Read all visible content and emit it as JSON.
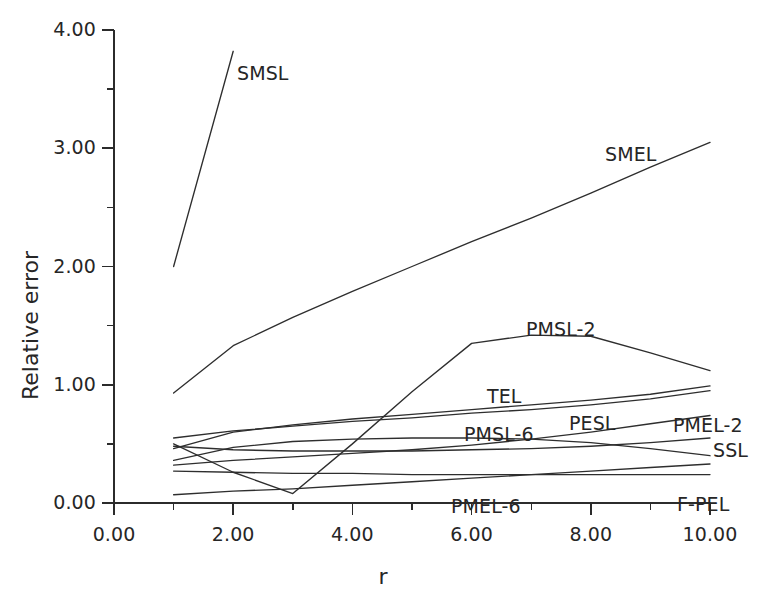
{
  "chart_data": {
    "type": "line",
    "title": "",
    "xlabel": "r",
    "ylabel": "Relative error",
    "xlim": [
      0,
      10
    ],
    "ylim": [
      0,
      4
    ],
    "grid": false,
    "legend": "inline-annotations",
    "x_ticks": [
      "0.00",
      "2.00",
      "4.00",
      "6.00",
      "8.00",
      "10.00"
    ],
    "x_tick_values": [
      0,
      2,
      4,
      6,
      8,
      10
    ],
    "x_minor_tick_values": [
      1,
      3,
      5,
      7,
      9
    ],
    "y_ticks": [
      "0.00",
      "1.00",
      "2.00",
      "3.00",
      "4.00"
    ],
    "y_tick_values": [
      0,
      1,
      2,
      3,
      4
    ],
    "y_minor_tick_values": [
      0.5,
      1.5,
      2.5,
      3.5
    ],
    "x": [
      1,
      2,
      3,
      4,
      5,
      6,
      7,
      8,
      9,
      10
    ],
    "series": [
      {
        "name": "SMSL",
        "label": "SMSL",
        "x": [
          1,
          2
        ],
        "values": [
          2.0,
          3.82
        ]
      },
      {
        "name": "SMEL",
        "label": "SMEL",
        "x": [
          1,
          2,
          3,
          4,
          5,
          6,
          7,
          8,
          9,
          10
        ],
        "values": [
          0.93,
          1.33,
          1.57,
          1.79,
          2.0,
          2.21,
          2.41,
          2.62,
          2.84,
          3.05
        ]
      },
      {
        "name": "PMSL-2",
        "label": "PMSL-2",
        "x": [
          1,
          2,
          3,
          4,
          5,
          6,
          7,
          8,
          9,
          10
        ],
        "values": [
          0.5,
          0.26,
          0.08,
          0.5,
          0.94,
          1.35,
          1.42,
          1.41,
          1.27,
          1.12
        ]
      },
      {
        "name": "TEL",
        "label": "TEL",
        "x": [
          1,
          2,
          3,
          4,
          5,
          6,
          7,
          8,
          9,
          10
        ],
        "values": [
          0.46,
          0.6,
          0.66,
          0.71,
          0.75,
          0.79,
          0.83,
          0.87,
          0.92,
          0.99
        ]
      },
      {
        "name": "PESL",
        "label": "PESL",
        "x": [
          1,
          2,
          3,
          4,
          5,
          6,
          7,
          8,
          9,
          10
        ],
        "values": [
          0.55,
          0.61,
          0.65,
          0.69,
          0.72,
          0.76,
          0.79,
          0.83,
          0.88,
          0.95
        ]
      },
      {
        "name": "PMSL-6",
        "label": "PMSL-6",
        "x": [
          1,
          2,
          3,
          4,
          5,
          6,
          7,
          8,
          9,
          10
        ],
        "values": [
          0.36,
          0.47,
          0.52,
          0.54,
          0.55,
          0.55,
          0.54,
          0.51,
          0.46,
          0.4
        ]
      },
      {
        "name": "PMEL-2",
        "label": "PMEL-2",
        "x": [
          1,
          2,
          3,
          4,
          5,
          6,
          7,
          8,
          9,
          10
        ],
        "values": [
          0.32,
          0.36,
          0.39,
          0.42,
          0.45,
          0.49,
          0.54,
          0.6,
          0.67,
          0.74
        ]
      },
      {
        "name": "SSL",
        "label": "SSL",
        "x": [
          1,
          2,
          3,
          4,
          5,
          6,
          7,
          8,
          9,
          10
        ],
        "values": [
          0.48,
          0.45,
          0.44,
          0.44,
          0.44,
          0.45,
          0.46,
          0.48,
          0.51,
          0.55
        ]
      },
      {
        "name": "PMEL-6",
        "label": "PMEL-6",
        "x": [
          1,
          2,
          3,
          4,
          5,
          6,
          7,
          8,
          9,
          10
        ],
        "values": [
          0.07,
          0.1,
          0.12,
          0.15,
          0.18,
          0.21,
          0.24,
          0.27,
          0.3,
          0.33
        ]
      },
      {
        "name": "F-PEL",
        "label": "F-PEL",
        "x": [
          1,
          2,
          3,
          4,
          5,
          6,
          7,
          8,
          9,
          10
        ],
        "values": [
          0.27,
          0.26,
          0.25,
          0.25,
          0.24,
          0.24,
          0.24,
          0.24,
          0.24,
          0.24
        ]
      },
      {
        "name": "baseline-zero",
        "label": "",
        "x": [
          1,
          2,
          3,
          4,
          5,
          6,
          7,
          8,
          9,
          10
        ],
        "values": [
          0.0,
          0.0,
          0.0,
          0.0,
          0.0,
          0.0,
          0.0,
          0.0,
          0.0,
          0.0
        ]
      }
    ],
    "annotations": [
      {
        "text": "SMSL",
        "x_px": 237,
        "y_px": 62
      },
      {
        "text": "SMEL",
        "x_px": 605,
        "y_px": 143
      },
      {
        "text": "PMSL-2",
        "x_px": 526,
        "y_px": 318
      },
      {
        "text": "TEL",
        "x_px": 487,
        "y_px": 385
      },
      {
        "text": "PESL",
        "x_px": 569,
        "y_px": 412
      },
      {
        "text": "PMSL-6",
        "x_px": 464,
        "y_px": 423
      },
      {
        "text": "PMEL-2",
        "x_px": 673,
        "y_px": 414
      },
      {
        "text": "SSL",
        "x_px": 713,
        "y_px": 439
      },
      {
        "text": "PMEL-6",
        "x_px": 451,
        "y_px": 495
      },
      {
        "text": "F-PEL",
        "x_px": 677,
        "y_px": 493
      }
    ],
    "colors": {
      "line": "#2e2e2e",
      "axis": "#2b2b2b",
      "text": "#262626",
      "background": "#ffffff"
    }
  }
}
